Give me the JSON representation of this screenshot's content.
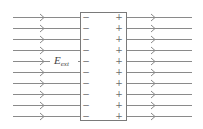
{
  "diagram": {
    "label": {
      "main": "E",
      "subscript": "ext"
    },
    "field_lines": {
      "count": 10,
      "y": [
        17,
        28,
        39,
        50,
        61,
        72,
        83,
        94,
        105,
        116
      ],
      "direction": "right"
    },
    "slab": {
      "left_sign": "−",
      "right_sign": "+",
      "x": 80,
      "y": 12,
      "width": 46,
      "height": 108
    },
    "colors": {
      "line": "#8a8a8a",
      "box": "#7a7a7a",
      "text": "#444444"
    }
  }
}
